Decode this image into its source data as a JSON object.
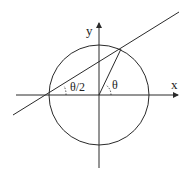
{
  "diagram": {
    "title": "",
    "labels": {
      "x_axis": "x",
      "y_axis": "y",
      "angle_center": "θ",
      "angle_edge": "θ/2"
    },
    "colors": {
      "stroke": "#2a2a2a",
      "background": "#ffffff"
    },
    "geometry": {
      "circle": {
        "cx": 99,
        "cy": 95,
        "r": 50
      },
      "x_axis": {
        "x1": 16,
        "y1": 95,
        "x2": 178,
        "y2": 95
      },
      "y_axis": {
        "x1": 99,
        "y1": 168,
        "x2": 99,
        "y2": 23
      },
      "secant_line": {
        "x1": 13,
        "y1": 115,
        "x2": 179,
        "y2": 12
      },
      "radius_segment": {
        "x1": 99,
        "y1": 95,
        "x2": 121,
        "y2": 49
      }
    }
  }
}
